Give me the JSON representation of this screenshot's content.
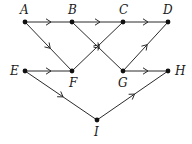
{
  "diagram": {
    "type": "directed-graph",
    "colors": {
      "stroke": "#2a2a2a",
      "node": "#111111",
      "label": "#1a1a1a",
      "background": "#ffffff"
    },
    "nodes": [
      {
        "id": "A",
        "label": "A",
        "x": 25,
        "y": 22,
        "lx": 20,
        "ly": 14
      },
      {
        "id": "B",
        "label": "B",
        "x": 72,
        "y": 22,
        "lx": 68,
        "ly": 14
      },
      {
        "id": "C",
        "label": "C",
        "x": 123,
        "y": 22,
        "lx": 119,
        "ly": 14
      },
      {
        "id": "D",
        "label": "D",
        "x": 168,
        "y": 22,
        "lx": 163,
        "ly": 14
      },
      {
        "id": "E",
        "label": "E",
        "x": 25,
        "y": 71,
        "lx": 10,
        "ly": 75
      },
      {
        "id": "F",
        "label": "F",
        "x": 72,
        "y": 71,
        "lx": 69,
        "ly": 87
      },
      {
        "id": "G",
        "label": "G",
        "x": 123,
        "y": 71,
        "lx": 118,
        "ly": 87
      },
      {
        "id": "H",
        "label": "H",
        "x": 168,
        "y": 71,
        "lx": 175,
        "ly": 75
      },
      {
        "id": "I",
        "label": "I",
        "x": 97,
        "y": 120,
        "lx": 94,
        "ly": 136
      }
    ],
    "edges": [
      {
        "from": "A",
        "to": "B"
      },
      {
        "from": "B",
        "to": "C"
      },
      {
        "from": "C",
        "to": "D"
      },
      {
        "from": "A",
        "to": "F"
      },
      {
        "from": "F",
        "to": "C"
      },
      {
        "from": "B",
        "to": "G"
      },
      {
        "from": "G",
        "to": "D"
      },
      {
        "from": "E",
        "to": "F"
      },
      {
        "from": "G",
        "to": "H"
      },
      {
        "from": "E",
        "to": "I"
      },
      {
        "from": "I",
        "to": "H"
      }
    ]
  }
}
